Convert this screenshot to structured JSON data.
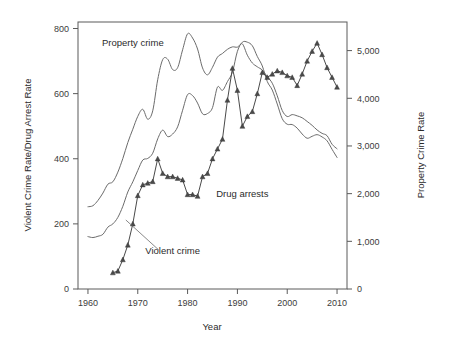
{
  "chart_data": {
    "type": "line",
    "title": "",
    "xlabel": "Year",
    "ylabel": "Violent Crime Rate/Drug Arrest Rate",
    "y2label": "Property Crime Rate",
    "xlim": [
      1958,
      2012
    ],
    "ylim": [
      0,
      820
    ],
    "y2lim": [
      0,
      5600
    ],
    "grid": false,
    "legend": "inline-annotations",
    "xticks": [
      "1960",
      "1970",
      "1980",
      "1990",
      "2000",
      "2010"
    ],
    "xtick_values": [
      1960,
      1970,
      1980,
      1990,
      2000,
      2010
    ],
    "yticks": [
      "0",
      "200",
      "400",
      "600",
      "800"
    ],
    "ytick_values": [
      0,
      200,
      400,
      600,
      800
    ],
    "y2ticks": [
      "0",
      "1,000",
      "2,000",
      "3,000",
      "4,000",
      "5,000"
    ],
    "y2tick_values": [
      0,
      1000,
      2000,
      3000,
      4000,
      5000
    ],
    "annotations": [
      {
        "text": "Property crime",
        "x": 1969,
        "y": 745,
        "axis": "left"
      },
      {
        "text": "Violent crime",
        "x": 1977,
        "y": 108,
        "axis": "left"
      },
      {
        "text": "Drug arrests",
        "x": 1991,
        "y": 282,
        "axis": "left"
      }
    ],
    "series": [
      {
        "name": "Property crime",
        "axis": "right",
        "marker": "none",
        "x": [
          1960,
          1961,
          1962,
          1963,
          1964,
          1965,
          1966,
          1967,
          1968,
          1969,
          1970,
          1971,
          1972,
          1973,
          1974,
          1975,
          1976,
          1977,
          1978,
          1979,
          1980,
          1981,
          1982,
          1983,
          1984,
          1985,
          1986,
          1987,
          1988,
          1989,
          1990,
          1991,
          1992,
          1993,
          1994,
          1995,
          1996,
          1997,
          1998,
          1999,
          2000,
          2001,
          2002,
          2003,
          2004,
          2005,
          2006,
          2007,
          2008,
          2009,
          2010
        ],
        "values": [
          1726,
          1747,
          1857,
          2012,
          2198,
          2249,
          2451,
          2737,
          3071,
          3351,
          3621,
          3769,
          3561,
          3737,
          4389,
          4811,
          4820,
          4602,
          4643,
          5017,
          5353,
          5264,
          5033,
          4637,
          4492,
          4651,
          4863,
          4940,
          5027,
          5078,
          5073,
          5140,
          4903,
          4740,
          4660,
          4591,
          4451,
          4316,
          4052,
          3743,
          3618,
          3658,
          3631,
          3591,
          3514,
          3432,
          3335,
          3264,
          3215,
          3036,
          2941
        ]
      },
      {
        "name": "Violent crime",
        "axis": "left",
        "marker": "none",
        "x": [
          1960,
          1961,
          1962,
          1963,
          1964,
          1965,
          1966,
          1967,
          1968,
          1969,
          1970,
          1971,
          1972,
          1973,
          1974,
          1975,
          1976,
          1977,
          1978,
          1979,
          1980,
          1981,
          1982,
          1983,
          1984,
          1985,
          1986,
          1987,
          1988,
          1989,
          1990,
          1991,
          1992,
          1993,
          1994,
          1995,
          1996,
          1997,
          1998,
          1999,
          2000,
          2001,
          2002,
          2003,
          2004,
          2005,
          2006,
          2007,
          2008,
          2009,
          2010
        ],
        "values": [
          161,
          158,
          162,
          168,
          190,
          200,
          220,
          254,
          298,
          329,
          364,
          396,
          401,
          417,
          461,
          488,
          468,
          476,
          498,
          549,
          597,
          594,
          571,
          538,
          539,
          557,
          620,
          610,
          637,
          666,
          730,
          758,
          758,
          747,
          714,
          685,
          637,
          611,
          568,
          523,
          506,
          505,
          494,
          476,
          463,
          469,
          474,
          467,
          455,
          429,
          404
        ]
      },
      {
        "name": "Drug arrests",
        "axis": "left",
        "marker": "triangle",
        "x": [
          1965,
          1966,
          1967,
          1968,
          1969,
          1970,
          1971,
          1972,
          1973,
          1974,
          1975,
          1976,
          1977,
          1978,
          1979,
          1980,
          1981,
          1982,
          1983,
          1984,
          1985,
          1986,
          1987,
          1988,
          1989,
          1990,
          1991,
          1992,
          1993,
          1994,
          1995,
          1996,
          1997,
          1998,
          1999,
          2000,
          2001,
          2002,
          2003,
          2004,
          2005,
          2006,
          2007,
          2008,
          2009,
          2010
        ],
        "values": [
          50,
          55,
          90,
          135,
          200,
          287,
          320,
          325,
          330,
          400,
          355,
          345,
          345,
          340,
          335,
          290,
          290,
          285,
          345,
          355,
          400,
          430,
          460,
          580,
          678,
          610,
          500,
          530,
          545,
          600,
          665,
          650,
          660,
          670,
          665,
          655,
          650,
          625,
          660,
          700,
          730,
          755,
          720,
          680,
          650,
          620
        ]
      }
    ]
  },
  "axes": {
    "left_title": "Violent Crime Rate/Drug Arrest Rate",
    "right_title": "Property Crime Rate",
    "x_title": "Year"
  }
}
